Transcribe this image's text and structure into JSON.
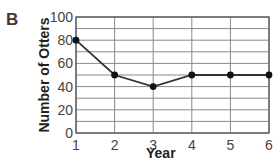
{
  "panel_label": "B",
  "chart_data": {
    "type": "line",
    "title": "",
    "xlabel": "Year",
    "ylabel": "Number of Otters",
    "x": [
      1,
      2,
      3,
      4,
      5,
      6
    ],
    "series": [
      {
        "name": "Otters",
        "values": [
          80,
          50,
          40,
          50,
          50,
          50
        ]
      }
    ],
    "xticks": [
      "1",
      "2",
      "3",
      "4",
      "5",
      "6"
    ],
    "yticks": [
      "0",
      "20",
      "40",
      "60",
      "80",
      "100"
    ],
    "xlim": [
      1,
      6
    ],
    "ylim": [
      0,
      100
    ],
    "grid": true,
    "grid_minor_y_step": 10,
    "legend": null,
    "markers": true
  }
}
